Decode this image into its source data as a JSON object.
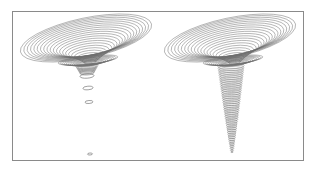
{
  "figure": {
    "line_color": "#6e6e6e",
    "frame_color": "#8a8a8a",
    "background": "#ffffff",
    "panels": [
      {
        "id": "left-funnel",
        "label": "",
        "rim": {
          "cx": 86,
          "cy": 38,
          "rx": 67,
          "ry": 20,
          "tilt": -12
        },
        "throat": {
          "cx": 86,
          "cy": 66
        },
        "ring_count": 22,
        "detached_rings": [
          {
            "cx": 87,
            "cy": 76,
            "rx": 7,
            "ry": 2.2
          },
          {
            "cx": 88,
            "cy": 88,
            "rx": 5,
            "ry": 1.8
          },
          {
            "cx": 89,
            "cy": 102,
            "rx": 4,
            "ry": 1.5
          },
          {
            "cx": 90,
            "cy": 154,
            "rx": 2.5,
            "ry": 1
          }
        ]
      },
      {
        "id": "right-funnel",
        "label": "",
        "rim": {
          "cx": 230,
          "cy": 38,
          "rx": 67,
          "ry": 20,
          "tilt": -12
        },
        "throat": {
          "cx": 231,
          "cy": 66
        },
        "ring_count": 22,
        "tail_end": {
          "x": 232,
          "y": 152
        }
      }
    ]
  }
}
